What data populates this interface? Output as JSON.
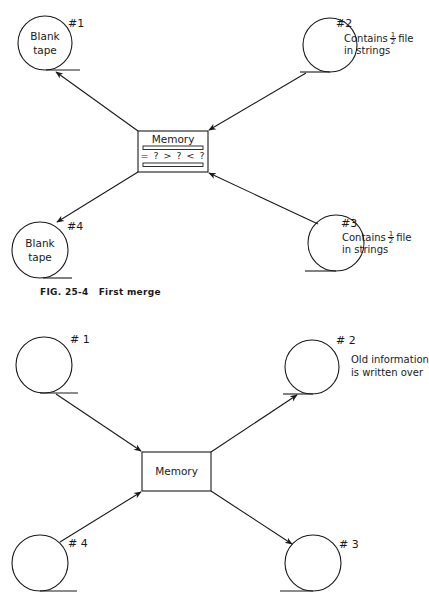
{
  "figure_top": {
    "caption": {
      "label": "FIG. 25-4",
      "title": "First merge"
    },
    "memory": {
      "label": "Memory",
      "comparison": "= ? > ? < ?"
    },
    "tapes": [
      {
        "id": "#1",
        "inner_line1": "Blank",
        "inner_line2": "tape",
        "note_line1": "",
        "note_line2": ""
      },
      {
        "id": "#2",
        "inner_line1": "",
        "inner_line2": "",
        "note_prefix": "Contains",
        "note_frac_num": "1",
        "note_frac_den": "2",
        "note_suffix": "file",
        "note_line2": "in strings"
      },
      {
        "id": "#3",
        "inner_line1": "",
        "inner_line2": "",
        "note_prefix": "Contains",
        "note_frac_num": "1",
        "note_frac_den": "2",
        "note_suffix": "file",
        "note_line2": "in strings"
      },
      {
        "id": "#4",
        "inner_line1": "Blank",
        "inner_line2": "tape",
        "note_line1": "",
        "note_line2": ""
      }
    ],
    "flows": [
      {
        "from": "#2",
        "to": "memory"
      },
      {
        "from": "#3",
        "to": "memory"
      },
      {
        "from": "memory",
        "to": "#1"
      },
      {
        "from": "memory",
        "to": "#4"
      }
    ]
  },
  "figure_bottom": {
    "memory": {
      "label": "Memory"
    },
    "tapes": [
      {
        "id": "# 1"
      },
      {
        "id": "# 2",
        "note_line1": "Old information",
        "note_line2": "is written over"
      },
      {
        "id": "# 3"
      },
      {
        "id": "# 4"
      }
    ],
    "flows": [
      {
        "from": "#1",
        "to": "memory"
      },
      {
        "from": "#4",
        "to": "memory"
      },
      {
        "from": "memory",
        "to": "#2"
      },
      {
        "from": "memory",
        "to": "#3"
      }
    ]
  },
  "colors": {
    "ink": "#1a1a1a",
    "background": "#ffffff"
  }
}
